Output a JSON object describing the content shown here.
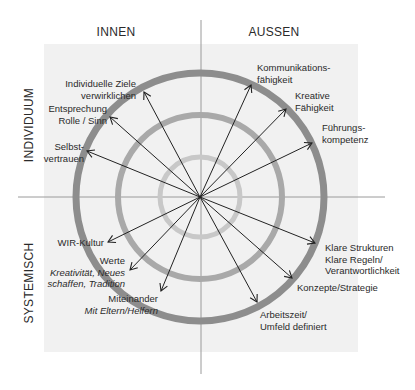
{
  "diagram": {
    "quadrant_headers": {
      "top_left": "INNEN",
      "top_right": "AUSSEN",
      "left_top": "INDIVIDUUM",
      "left_bottom": "SYSTEMISCH"
    },
    "center": [
      200,
      197
    ],
    "rings": [
      {
        "name": "inner",
        "radius": 40,
        "color": "#c8c8c8",
        "width": 5
      },
      {
        "name": "middle",
        "radius": 82,
        "color": "#a9a9a9",
        "width": 6
      },
      {
        "name": "outer",
        "radius": 124,
        "color": "#8d8d8d",
        "width": 7
      }
    ],
    "colors": {
      "background_panel": "#f1f1f1",
      "axis_line": "#9a9a9a",
      "arrow": "#222222",
      "text": "#2a2a2a"
    },
    "items": [
      {
        "id": "individuelle-ziele",
        "lines": [
          "Individuelle Ziele",
          "verwirklichen"
        ],
        "italic": [
          false,
          false
        ],
        "anchor": "end",
        "tx": 136,
        "ty": 87,
        "ax": 144,
        "ay": 92
      },
      {
        "id": "entsprechung",
        "lines": [
          "Entsprechung",
          "Rolle / Sinn"
        ],
        "italic": [
          false,
          false
        ],
        "anchor": "end",
        "tx": 107,
        "ty": 112,
        "ax": 110,
        "ay": 117
      },
      {
        "id": "selbstvertrauen",
        "lines": [
          "Selbst-",
          "vertrauen"
        ],
        "italic": [
          false,
          false
        ],
        "anchor": "end",
        "tx": 84,
        "ty": 150,
        "ax": 87,
        "ay": 151
      },
      {
        "id": "kommunikation",
        "lines": [
          "Kommunikations-",
          "fähigkeit"
        ],
        "italic": [
          false,
          false
        ],
        "anchor": "start",
        "tx": 257,
        "ty": 71,
        "ax": 251,
        "ay": 85
      },
      {
        "id": "kreative",
        "lines": [
          "Kreative",
          "Fähigkeit"
        ],
        "italic": [
          false,
          false
        ],
        "anchor": "start",
        "tx": 295,
        "ty": 99,
        "ax": 286,
        "ay": 109
      },
      {
        "id": "fuehrung",
        "lines": [
          "Führungs-",
          "kompetenz"
        ],
        "italic": [
          false,
          false
        ],
        "anchor": "start",
        "tx": 322,
        "ty": 131,
        "ax": 312,
        "ay": 143
      },
      {
        "id": "wir-kultur",
        "lines": [
          "WIR-Kultur"
        ],
        "italic": [
          false
        ],
        "anchor": "end",
        "tx": 104,
        "ty": 246,
        "ax": 108,
        "ay": 242
      },
      {
        "id": "werte",
        "lines": [
          "Werte",
          "Kreativität, Neues",
          "schaffen, Tradition"
        ],
        "italic": [
          false,
          true,
          true
        ],
        "anchor": "end",
        "tx": 125,
        "ty": 264,
        "ax": 130,
        "ay": 270
      },
      {
        "id": "miteinander",
        "lines": [
          "Miteinander",
          "Mit Eltern/Helfern"
        ],
        "italic": [
          false,
          true
        ],
        "anchor": "end",
        "tx": 158,
        "ty": 302,
        "ax": 161,
        "ay": 291
      },
      {
        "id": "klare-strukturen",
        "lines": [
          "Klare Strukturen",
          "Klare Regeln/",
          "Verantwortlichkeit"
        ],
        "italic": [
          false,
          false,
          false
        ],
        "anchor": "start",
        "tx": 325,
        "ty": 251,
        "ax": 315,
        "ay": 243
      },
      {
        "id": "konzepte",
        "lines": [
          "Konzepte/Strategie"
        ],
        "italic": [
          false
        ],
        "anchor": "start",
        "tx": 297,
        "ty": 291,
        "ax": 292,
        "ay": 278
      },
      {
        "id": "arbeitszeit",
        "lines": [
          "Arbeitszeit/",
          "Umfeld definiert"
        ],
        "italic": [
          false,
          false
        ],
        "anchor": "start",
        "tx": 260,
        "ty": 318,
        "ax": 257,
        "ay": 302
      }
    ]
  }
}
